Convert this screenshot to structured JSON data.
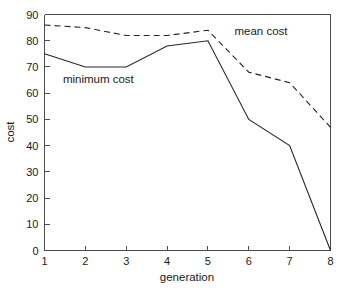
{
  "chart_data": {
    "type": "line",
    "title": "",
    "xlabel": "generation",
    "ylabel": "cost",
    "x": [
      1,
      2,
      3,
      4,
      5,
      6,
      7,
      8
    ],
    "xlim": [
      1,
      8
    ],
    "ylim": [
      0,
      90
    ],
    "xticks": [
      "1",
      "2",
      "3",
      "4",
      "5",
      "6",
      "7",
      "8"
    ],
    "yticks": [
      "0",
      "10",
      "20",
      "30",
      "40",
      "50",
      "60",
      "70",
      "80",
      "90"
    ],
    "grid": false,
    "legend_position": "inline-annotations",
    "series": [
      {
        "name": "mean cost",
        "style": "dashed",
        "color": "#262626",
        "values": [
          86,
          85,
          82,
          82,
          84,
          68,
          64,
          47
        ]
      },
      {
        "name": "minimum cost",
        "style": "solid",
        "color": "#262626",
        "values": [
          75,
          70,
          70,
          78,
          80,
          50,
          40,
          0
        ]
      }
    ],
    "annotations": [
      {
        "text": "mean cost",
        "x": 5.65,
        "y": 82
      },
      {
        "text": "minimum cost",
        "x": 1.45,
        "y": 64
      }
    ]
  }
}
